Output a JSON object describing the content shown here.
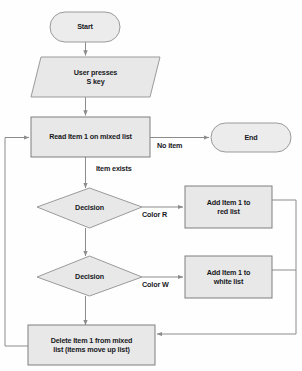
{
  "diagram": {
    "style": {
      "shape_fill": "#e8e8e8",
      "shape_stroke": "#9a9a9a",
      "terminator_fill": "#ececec",
      "line_color": "#8c8c8c",
      "text_color": "#17181c",
      "background": "#fefefe"
    },
    "nodes": [
      {
        "id": "start",
        "shape": "terminator",
        "label": "Start"
      },
      {
        "id": "input",
        "shape": "parallelogram",
        "label": "User presses\nS key",
        "line1": "User presses",
        "line2": "S key"
      },
      {
        "id": "read",
        "shape": "process",
        "label": "Read Item 1 on mixed list"
      },
      {
        "id": "end",
        "shape": "terminator",
        "label": "End"
      },
      {
        "id": "decision1",
        "shape": "decision",
        "label": "Decision"
      },
      {
        "id": "addred",
        "shape": "process",
        "label": "Add Item 1 to\nred list",
        "line1": "Add Item 1 to",
        "line2": "red list"
      },
      {
        "id": "decision2",
        "shape": "decision",
        "label": "Decision"
      },
      {
        "id": "addwhite",
        "shape": "process",
        "label": "Add Item 1 to\nwhite list",
        "line1": "Add Item 1 to",
        "line2": "white list"
      },
      {
        "id": "delete",
        "shape": "process",
        "label": "Delete Item 1 from mixed\nlist (items move up list)",
        "line1": "Delete Item 1 from mixed",
        "line2": "list (items move up list)"
      }
    ],
    "edge_labels": [
      {
        "id": "no-item",
        "label": "No item"
      },
      {
        "id": "item-exists",
        "label": "Item exists"
      },
      {
        "id": "color-r",
        "label": "Color R"
      },
      {
        "id": "color-w",
        "label": "Color W"
      }
    ]
  }
}
